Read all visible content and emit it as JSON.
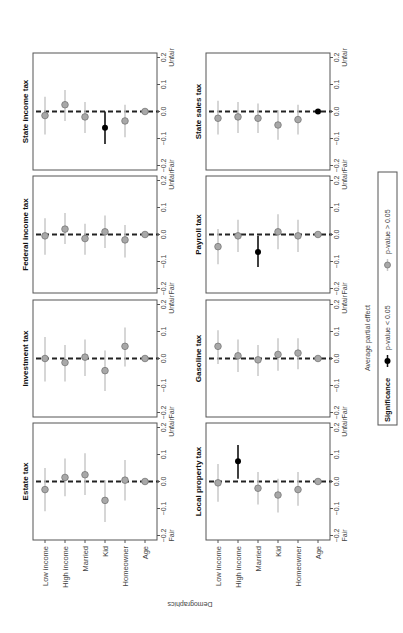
{
  "figure": {
    "orientation": "rotated 90 degrees counter-clockwise",
    "y_axis_title": "Demographics",
    "x_axis_title": "Average partial effect",
    "scale_left_word": "Fair",
    "scale_right_word": "Unfair",
    "tick_labels": [
      "−0.2",
      "−0.1",
      "0.0",
      "0.1",
      "0.2"
    ],
    "colors": {
      "significant": "#000000",
      "not_significant": "#a8a8a8",
      "ci_not_significant": "#c8c8c8",
      "frame": "#555555"
    }
  },
  "legend": {
    "title": "Significance",
    "items": [
      {
        "label": "p-value < 0.05",
        "style": "significant"
      },
      {
        "label": "p-value > 0.05",
        "style": "not_significant"
      }
    ]
  },
  "chart_data": {
    "type": "scatter",
    "subtype": "coefficient plot (dot with 95% CI), small multiples",
    "title": "",
    "xlabel": "Average partial effect",
    "ylabel": "Demographics",
    "xlim": [
      -0.2,
      0.2
    ],
    "xticks": [
      -0.2,
      -0.1,
      0.0,
      0.1,
      0.2
    ],
    "axis_end_labels": {
      "negative": "Fair",
      "positive": "Unfair"
    },
    "reference_line": {
      "x": 0.0,
      "style": "dashed"
    },
    "categories": [
      "Low income",
      "High income",
      "Married",
      "Kid",
      "Homeowner",
      "Age"
    ],
    "legend": {
      "title": "Significance",
      "entries": [
        "p-value < 0.05",
        "p-value > 0.05"
      ],
      "position": "bottom"
    },
    "panels": [
      {
        "title": "Estate tax",
        "estimates": [
          -0.03,
          0.015,
          0.025,
          -0.07,
          0.005,
          0.0
        ],
        "ci_low": [
          -0.11,
          -0.055,
          -0.05,
          -0.15,
          -0.07,
          -0.005
        ],
        "ci_high": [
          0.05,
          0.085,
          0.105,
          0.005,
          0.08,
          0.005
        ],
        "significant": [
          false,
          false,
          false,
          false,
          false,
          false
        ]
      },
      {
        "title": "Investment tax",
        "estimates": [
          0.0,
          -0.015,
          0.005,
          -0.045,
          0.045,
          0.0
        ],
        "ci_low": [
          -0.085,
          -0.085,
          -0.065,
          -0.12,
          -0.03,
          -0.005
        ],
        "ci_high": [
          0.08,
          0.05,
          0.07,
          0.03,
          0.115,
          0.005
        ],
        "significant": [
          false,
          false,
          false,
          false,
          false,
          false
        ]
      },
      {
        "title": "Federal income tax",
        "estimates": [
          -0.005,
          0.02,
          -0.015,
          0.01,
          -0.02,
          0.0
        ],
        "ci_low": [
          -0.075,
          -0.035,
          -0.075,
          -0.05,
          -0.085,
          -0.005
        ],
        "ci_high": [
          0.06,
          0.08,
          0.04,
          0.07,
          0.035,
          0.005
        ],
        "significant": [
          false,
          false,
          false,
          false,
          false,
          false
        ]
      },
      {
        "title": "State income tax",
        "estimates": [
          -0.015,
          0.025,
          -0.02,
          -0.06,
          -0.035,
          0.0
        ],
        "ci_low": [
          -0.085,
          -0.035,
          -0.08,
          -0.12,
          -0.095,
          -0.005
        ],
        "ci_high": [
          0.055,
          0.08,
          0.035,
          0.0,
          0.025,
          0.005
        ],
        "significant": [
          false,
          false,
          false,
          true,
          false,
          false
        ]
      },
      {
        "title": "Local property tax",
        "estimates": [
          -0.005,
          0.075,
          -0.025,
          -0.05,
          -0.03,
          0.0
        ],
        "ci_low": [
          -0.075,
          0.01,
          -0.085,
          -0.115,
          -0.09,
          -0.005
        ],
        "ci_high": [
          0.065,
          0.135,
          0.035,
          0.01,
          0.035,
          0.005
        ],
        "significant": [
          false,
          true,
          false,
          false,
          false,
          false
        ]
      },
      {
        "title": "Gasoline tax",
        "estimates": [
          0.045,
          0.01,
          -0.005,
          0.015,
          0.02,
          0.0
        ],
        "ci_low": [
          -0.02,
          -0.05,
          -0.065,
          -0.045,
          -0.04,
          -0.005
        ],
        "ci_high": [
          0.105,
          0.07,
          0.05,
          0.075,
          0.075,
          0.005
        ],
        "significant": [
          false,
          false,
          false,
          false,
          false,
          false
        ]
      },
      {
        "title": "Payroll tax",
        "estimates": [
          -0.045,
          -0.005,
          -0.065,
          0.01,
          -0.005,
          0.0
        ],
        "ci_low": [
          -0.11,
          -0.065,
          -0.12,
          -0.055,
          -0.065,
          -0.005
        ],
        "ci_high": [
          0.02,
          0.055,
          -0.005,
          0.075,
          0.055,
          0.005
        ],
        "significant": [
          false,
          false,
          true,
          false,
          false,
          false
        ]
      },
      {
        "title": "State sales tax",
        "estimates": [
          -0.025,
          -0.02,
          -0.025,
          -0.05,
          -0.03,
          0.0
        ],
        "ci_low": [
          -0.085,
          -0.08,
          -0.08,
          -0.105,
          -0.085,
          -0.005
        ],
        "ci_high": [
          0.04,
          0.035,
          0.03,
          0.005,
          0.025,
          0.005
        ],
        "significant": [
          false,
          false,
          false,
          false,
          false,
          true
        ]
      }
    ],
    "grid": false
  }
}
